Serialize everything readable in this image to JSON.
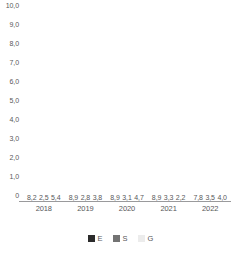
{
  "chart_data": {
    "type": "bar",
    "title": "",
    "subtitle": "",
    "xlabel": "",
    "ylabel": "",
    "ylim": [
      0,
      10
    ],
    "grid": false,
    "legend_position": "bottom-center",
    "decimal_separator": ",",
    "categories": [
      "2018",
      "2019",
      "2020",
      "2021",
      "2022"
    ],
    "y_ticks": [
      {
        "value": 10,
        "label": "10,0"
      },
      {
        "value": 9,
        "label": "9,0"
      },
      {
        "value": 8,
        "label": "8,0"
      },
      {
        "value": 7,
        "label": "7,0"
      },
      {
        "value": 6,
        "label": "6,0"
      },
      {
        "value": 5,
        "label": "5,0"
      },
      {
        "value": 4,
        "label": "4,0"
      },
      {
        "value": 3,
        "label": "3,0"
      },
      {
        "value": 2,
        "label": "2,0"
      },
      {
        "value": 1,
        "label": "1,0"
      },
      {
        "value": 0,
        "label": "0"
      }
    ],
    "series": [
      {
        "name": "E",
        "color": "#2b2b2b",
        "values": [
          8.2,
          8.9,
          8.9,
          8.9,
          7.8
        ],
        "labels": [
          "8,2",
          "8,9",
          "8,9",
          "8,9",
          "7,8"
        ]
      },
      {
        "name": "S",
        "color": "#737373",
        "values": [
          2.5,
          2.8,
          3.1,
          3.3,
          3.5
        ],
        "labels": [
          "2,5",
          "2,8",
          "3,1",
          "3,3",
          "3,5"
        ]
      },
      {
        "name": "G",
        "color": "#ececec",
        "values": [
          5.4,
          3.8,
          4.7,
          2.2,
          4.0
        ],
        "labels": [
          "5,4",
          "3,8",
          "4,7",
          "2,2",
          "4,0"
        ]
      }
    ]
  },
  "legend": {
    "items": [
      {
        "label": "E",
        "color": "#2b2b2b"
      },
      {
        "label": "S",
        "color": "#737373"
      },
      {
        "label": "G",
        "color": "#ececec"
      }
    ]
  },
  "colors": {
    "series_e": "#2b2b2b",
    "series_s": "#737373",
    "series_g": "#ececec",
    "axis": "#9a9a9c",
    "text": "#58585a",
    "background": "#ffffff"
  }
}
